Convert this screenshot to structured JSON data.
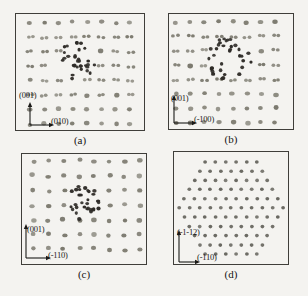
{
  "figure": {
    "colors": {
      "background": "#f4f3f0",
      "frame_border": "#3f3e3a",
      "lattice_dot": "#7c7a6f",
      "cluster_dot": "#2e2b27",
      "hex_dot": "#686760",
      "text": "#1b1a18"
    },
    "panels": [
      {
        "id": "a",
        "caption": "(a)",
        "axis_vertical": "(001)",
        "axis_horizontal": "(010)",
        "lattice": {
          "type": "rows",
          "rows": 8,
          "cols": 9,
          "x0": 14,
          "y0": 8.5,
          "dx": 14.3,
          "dy": 14.5,
          "row_styles": [
            "s",
            "p",
            "p",
            "p",
            "p",
            "p",
            "s",
            "s"
          ],
          "jitter": 2.0,
          "seed": 101,
          "cluster": {
            "cx": 60,
            "cy": 48,
            "r": 22,
            "count": 32,
            "ring": false
          }
        }
      },
      {
        "id": "b",
        "caption": "(b)",
        "axis_vertical": "(001)",
        "axis_horizontal": "(-100)",
        "lattice": {
          "type": "rows",
          "rows": 8,
          "cols": 9,
          "x0": 7,
          "y0": 8,
          "dx": 14.2,
          "dy": 14.4,
          "row_styles": [
            "s",
            "p",
            "p",
            "p",
            "p",
            "s",
            "s",
            "s"
          ],
          "jitter": 2.0,
          "seed": 202,
          "cluster": {
            "cx": 60,
            "cy": 45,
            "r": 23,
            "count": 34,
            "ring": true
          }
        }
      },
      {
        "id": "c",
        "caption": "(c)",
        "axis_vertical": "(001)",
        "axis_horizontal": "(-110)",
        "lattice": {
          "type": "rows",
          "rows": 8,
          "cols": 8,
          "x0": 11,
          "y0": 7,
          "dx": 15.3,
          "dy": 14.7,
          "row_styles": [
            "s",
            "s",
            "s",
            "s",
            "s",
            "s",
            "s",
            "s"
          ],
          "jitter": 2.6,
          "seed": 303,
          "cluster": {
            "cx": 61,
            "cy": 48,
            "r": 20,
            "count": 30,
            "ring": false
          }
        }
      },
      {
        "id": "d",
        "caption": "(d)",
        "axis_vertical": "(-1-12)",
        "axis_horizontal": "(-110)",
        "lattice": {
          "type": "hex",
          "cx": 57,
          "cy": 56,
          "radius": 53,
          "dx": 10.4,
          "dy": 9.2,
          "dot_r": 1.9,
          "jitter": 0.6,
          "seed": 404
        }
      }
    ]
  }
}
